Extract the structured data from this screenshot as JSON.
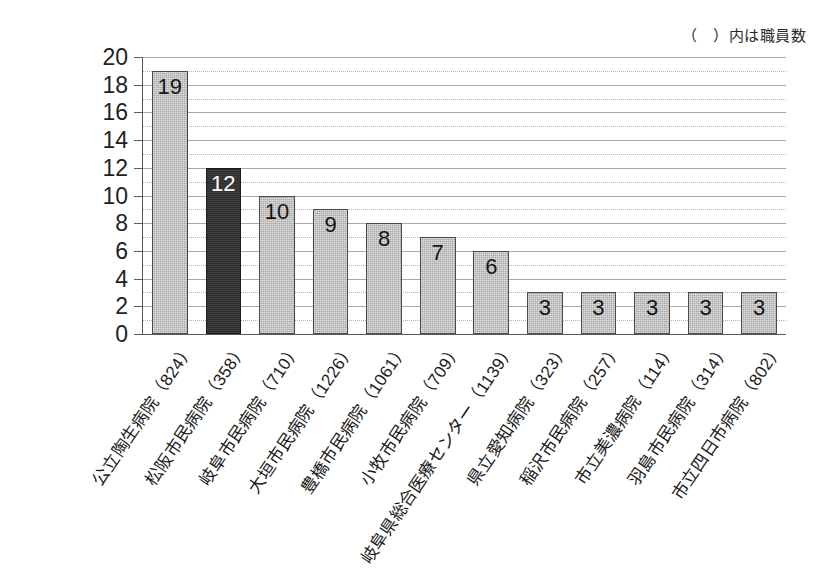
{
  "note": "（　）内は職員数",
  "chart_data": {
    "type": "bar",
    "title": "",
    "xlabel": "",
    "ylabel": "",
    "ylim": [
      0,
      20
    ],
    "ytick_step": 2,
    "grid": true,
    "legend": false,
    "annotations": [
      "（　）内は職員数"
    ],
    "ytick_labels": [
      "20",
      "18",
      "16",
      "14",
      "12",
      "10",
      "8",
      "6",
      "4",
      "2",
      "0"
    ],
    "highlight_index": 1,
    "colors": {
      "bar": "#a9a9a9",
      "bar_highlight": "#2f2f2f",
      "bar_border": "#4a4a4a",
      "axis": "#5a5a5a",
      "grid": "#a9a9a9",
      "text": "#1a1a1a",
      "highlight_label_text": "#ffffff"
    },
    "categories": [
      "公立陶生病院（824）",
      "松阪市民病院（358）",
      "岐阜市民病院（710）",
      "大垣市民病院（1226）",
      "豊橋市民病院（1061）",
      "小牧市民病院（709）",
      "岐阜県総合医療センター（1139）",
      "県立愛知病院（323）",
      "稲沢市民病院（257）",
      "市立美濃病院（114）",
      "羽島市民病院（314）",
      "市立四日市病院（802）"
    ],
    "hospital_names": [
      "公立陶生病院",
      "松阪市民病院",
      "岐阜市民病院",
      "大垣市民病院",
      "豊橋市民病院",
      "小牧市民病院",
      "岐阜県総合医療センター",
      "県立愛知病院",
      "稲沢市民病院",
      "市立美濃病院",
      "羽島市民病院",
      "市立四日市病院"
    ],
    "staff_counts": [
      824,
      358,
      710,
      1226,
      1061,
      709,
      1139,
      323,
      257,
      114,
      314,
      802
    ],
    "values": [
      19,
      12,
      10,
      9,
      8,
      7,
      6,
      3,
      3,
      3,
      3,
      3
    ]
  }
}
